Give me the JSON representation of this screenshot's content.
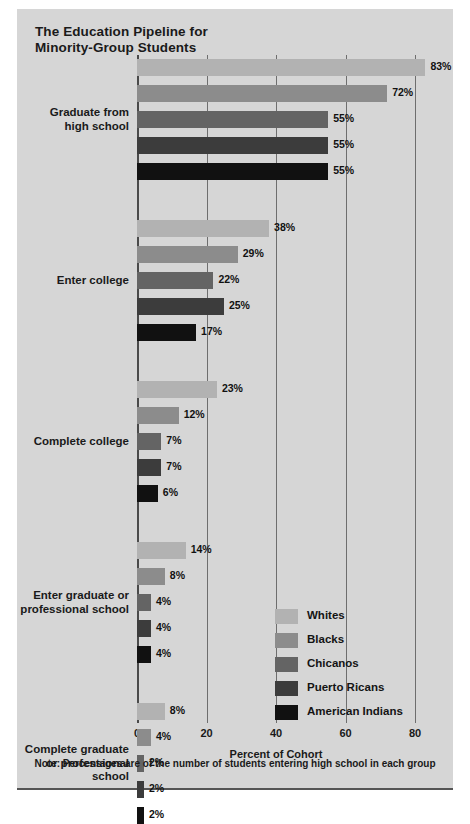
{
  "figure": {
    "title_line1": "The Education Pipeline for",
    "title_line2": "Minority-Group Students",
    "note": "Note: Percentages are of the number of students entering high school in each group",
    "background_color": "#d6d6d6"
  },
  "chart_data": {
    "type": "bar",
    "orientation": "horizontal",
    "title": "The Education Pipeline for Minority-Group Students",
    "xlabel": "Percent of Cohort",
    "ylabel": "",
    "xlim": [
      0,
      80
    ],
    "xticks": [
      0,
      20,
      40,
      60,
      80
    ],
    "xtick_labels": [
      "0",
      "20",
      "40",
      "60",
      "80"
    ],
    "grid": true,
    "grid_axis": "x",
    "legend_position": "inside-lower-right",
    "categories": [
      "Graduate from high school",
      "Enter college",
      "Complete college",
      "Enter graduate or professional school",
      "Complete graduate or professional school"
    ],
    "series": [
      {
        "name": "Whites",
        "color": "#b2b2b2",
        "values": [
          83,
          38,
          23,
          14,
          8
        ]
      },
      {
        "name": "Blacks",
        "color": "#8c8c8c",
        "values": [
          72,
          29,
          12,
          8,
          4
        ]
      },
      {
        "name": "Chicanos",
        "color": "#646464",
        "values": [
          55,
          22,
          7,
          4,
          2
        ]
      },
      {
        "name": "Puerto Ricans",
        "color": "#3c3c3c",
        "values": [
          55,
          25,
          7,
          4,
          2
        ]
      },
      {
        "name": "American Indians",
        "color": "#111111",
        "values": [
          55,
          17,
          6,
          4,
          2
        ]
      }
    ],
    "value_label_suffix": "%",
    "note": "Note: Percentages are of the number of students entering high school in each group"
  },
  "groups": [
    {
      "label_lines": [
        "Graduate from",
        "high school"
      ],
      "bars": [
        {
          "series": "Whites",
          "value": 83,
          "label": "83%",
          "color": "#b2b2b2"
        },
        {
          "series": "Blacks",
          "value": 72,
          "label": "72%",
          "color": "#8c8c8c"
        },
        {
          "series": "Chicanos",
          "value": 55,
          "label": "55%",
          "color": "#646464"
        },
        {
          "series": "Puerto Ricans",
          "value": 55,
          "label": "55%",
          "color": "#3c3c3c"
        },
        {
          "series": "American Indians",
          "value": 55,
          "label": "55%",
          "color": "#111111"
        }
      ]
    },
    {
      "label_lines": [
        "Enter college"
      ],
      "bars": [
        {
          "series": "Whites",
          "value": 38,
          "label": "38%",
          "color": "#b2b2b2"
        },
        {
          "series": "Blacks",
          "value": 29,
          "label": "29%",
          "color": "#8c8c8c"
        },
        {
          "series": "Chicanos",
          "value": 22,
          "label": "22%",
          "color": "#646464"
        },
        {
          "series": "Puerto Ricans",
          "value": 25,
          "label": "25%",
          "color": "#3c3c3c"
        },
        {
          "series": "American Indians",
          "value": 17,
          "label": "17%",
          "color": "#111111"
        }
      ]
    },
    {
      "label_lines": [
        "Complete college"
      ],
      "bars": [
        {
          "series": "Whites",
          "value": 23,
          "label": "23%",
          "color": "#b2b2b2"
        },
        {
          "series": "Blacks",
          "value": 12,
          "label": "12%",
          "color": "#8c8c8c"
        },
        {
          "series": "Chicanos",
          "value": 7,
          "label": "7%",
          "color": "#646464"
        },
        {
          "series": "Puerto Ricans",
          "value": 7,
          "label": "7%",
          "color": "#3c3c3c"
        },
        {
          "series": "American Indians",
          "value": 6,
          "label": "6%",
          "color": "#111111"
        }
      ]
    },
    {
      "label_lines": [
        "Enter graduate or",
        "professional school"
      ],
      "bars": [
        {
          "series": "Whites",
          "value": 14,
          "label": "14%",
          "color": "#b2b2b2"
        },
        {
          "series": "Blacks",
          "value": 8,
          "label": "8%",
          "color": "#8c8c8c"
        },
        {
          "series": "Chicanos",
          "value": 4,
          "label": "4%",
          "color": "#646464"
        },
        {
          "series": "Puerto Ricans",
          "value": 4,
          "label": "4%",
          "color": "#3c3c3c"
        },
        {
          "series": "American Indians",
          "value": 4,
          "label": "4%",
          "color": "#111111"
        }
      ]
    },
    {
      "label_lines": [
        "Complete graduate",
        "or professional",
        "school"
      ],
      "bars": [
        {
          "series": "Whites",
          "value": 8,
          "label": "8%",
          "color": "#b2b2b2"
        },
        {
          "series": "Blacks",
          "value": 4,
          "label": "4%",
          "color": "#8c8c8c"
        },
        {
          "series": "Chicanos",
          "value": 2,
          "label": "2%",
          "color": "#646464"
        },
        {
          "series": "Puerto Ricans",
          "value": 2,
          "label": "2%",
          "color": "#3c3c3c"
        },
        {
          "series": "American Indians",
          "value": 2,
          "label": "2%",
          "color": "#111111"
        }
      ]
    }
  ],
  "axis": {
    "ticks": [
      "0",
      "20",
      "40",
      "60",
      "80"
    ],
    "title": "Percent of Cohort"
  },
  "legend": {
    "items": [
      {
        "label": "Whites",
        "color": "#b2b2b2"
      },
      {
        "label": "Blacks",
        "color": "#8c8c8c"
      },
      {
        "label": "Chicanos",
        "color": "#646464"
      },
      {
        "label": "Puerto Ricans",
        "color": "#3c3c3c"
      },
      {
        "label": "American Indians",
        "color": "#111111"
      }
    ]
  }
}
